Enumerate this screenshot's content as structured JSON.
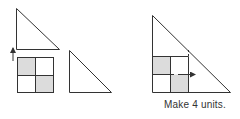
{
  "caption": "Make 4 units.",
  "colors": {
    "stroke": "#333333",
    "shade": "#dcdcdc",
    "background": "#ffffff"
  },
  "left_figure": {
    "triangle": "right triangle above the grid",
    "arrow": "up",
    "grid": {
      "rows": 2,
      "cols": 2,
      "shaded_cells": [
        "top-left",
        "bottom-right"
      ]
    },
    "second_triangle": "right triangle beside the grid"
  },
  "right_figure": {
    "composite": "grid placed in the corner of a larger right triangle",
    "grid": {
      "rows": 2,
      "cols": 2,
      "shaded_cells": [
        "top-left",
        "bottom-right"
      ]
    },
    "arrow": "right",
    "dashed_line": "vertical at right edge of grid"
  }
}
